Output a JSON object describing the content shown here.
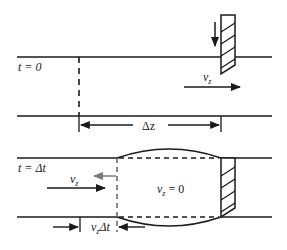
{
  "top_panel": {
    "time_label": "t = 0",
    "velocity_label": "v",
    "velocity_sub": "z",
    "delta_label": "Δz"
  },
  "bottom_panel": {
    "time_label": "t = Δt",
    "inflow_label": "v",
    "inflow_sub": "z",
    "stagnant_label": "v",
    "stagnant_sub": "z",
    "stagnant_value": " = 0",
    "distance_label_v": "v",
    "distance_label_sub": "z",
    "distance_label_rest": "Δt"
  },
  "colors": {
    "line": "#1a1a1a",
    "grey_arrow": "#7a7a7a"
  }
}
